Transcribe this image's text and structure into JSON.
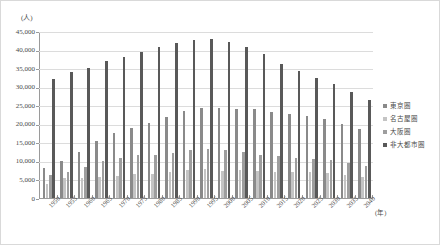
{
  "chart_data": {
    "type": "bar",
    "title": "",
    "subtitle": "",
    "xlabel": "(年)",
    "ylabel": "(人)",
    "ylim": [
      0,
      45000
    ],
    "ytick_step": 5000,
    "ytick_labels": [
      "45,000",
      "40,000",
      "35,000",
      "30,000",
      "25,000",
      "20,000",
      "15,000",
      "10,000",
      "5,000",
      "0"
    ],
    "ytick_values": [
      45000,
      40000,
      35000,
      30000,
      25000,
      20000,
      15000,
      10000,
      5000,
      0
    ],
    "grid": true,
    "legend_position": "right",
    "categories": [
      "1950",
      "1955",
      "1960",
      "1965",
      "1970",
      "1975",
      "1980",
      "1985",
      "1990",
      "1995",
      "2000",
      "2005",
      "2010",
      "2015",
      "2020",
      "2025",
      "2030",
      "2035",
      "2040"
    ],
    "series": [
      {
        "name": "東京圏",
        "color": "#8a8a8a",
        "values": [
          8100,
          10000,
          12300,
          15300,
          17400,
          19000,
          20200,
          21700,
          23500,
          24200,
          24300,
          24000,
          23900,
          23100,
          22600,
          22100,
          21400,
          20000,
          18500
        ]
      },
      {
        "name": "名古屋圏",
        "color": "#c4c4c4",
        "values": [
          3900,
          5300,
          5500,
          5700,
          6000,
          6400,
          6500,
          7000,
          7500,
          7700,
          7400,
          7600,
          7200,
          7100,
          7100,
          7000,
          6700,
          6200,
          5600
        ]
      },
      {
        "name": "大阪圏",
        "color": "#9e9e9e",
        "values": [
          6200,
          7100,
          8400,
          10100,
          10900,
          11500,
          11700,
          12200,
          13000,
          13100,
          12900,
          12300,
          11700,
          11200,
          10800,
          10500,
          10200,
          9500,
          8600
        ]
      },
      {
        "name": "非大都市圏",
        "color": "#595959",
        "values": [
          32200,
          33900,
          35000,
          36800,
          38000,
          39400,
          40800,
          41800,
          42500,
          42800,
          42100,
          40800,
          38700,
          36100,
          34100,
          32400,
          30700,
          28700,
          26300
        ]
      }
    ]
  },
  "legend": {
    "items": [
      {
        "label": "東京圏"
      },
      {
        "label": "名古屋圏"
      },
      {
        "label": "大阪圏"
      },
      {
        "label": "非大都市圏"
      }
    ]
  }
}
